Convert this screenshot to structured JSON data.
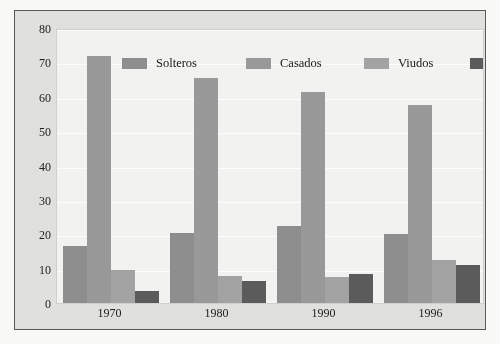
{
  "figure": {
    "frame_border_color": "#595959",
    "plot_background": "#f4f4f2",
    "page_background": "#fbfbfa",
    "gridline_color": "#ffffff"
  },
  "chart_data": {
    "type": "bar",
    "title": "",
    "subtitle": "",
    "xlabel": "",
    "ylabel": "",
    "categories": [
      "1970",
      "1980",
      "1990",
      "1996"
    ],
    "ylim": [
      0,
      80
    ],
    "yticks": [
      0,
      10,
      20,
      30,
      40,
      50,
      60,
      70,
      80
    ],
    "ytick_labels": [
      "0",
      "10",
      "20",
      "30",
      "40",
      "50",
      "60",
      "70",
      "80"
    ],
    "grid": true,
    "grid_axis": "y",
    "legend_position": "top-inside",
    "series": [
      {
        "name": "Solteros",
        "color": "#8f8f8f",
        "values": [
          16.5,
          20.5,
          22.5,
          20.0
        ]
      },
      {
        "name": "Casados",
        "color": "#9a9a9a",
        "values": [
          72.0,
          65.5,
          61.5,
          57.5
        ]
      },
      {
        "name": "Viudos",
        "color": "#a4a4a4",
        "values": [
          9.5,
          8.0,
          7.5,
          12.5
        ]
      },
      {
        "name": "Divorciados",
        "color": "#5c5c5c",
        "values": [
          3.5,
          6.5,
          8.5,
          11.0
        ]
      }
    ]
  },
  "legend": {
    "items": [
      {
        "label": "Solteros",
        "color": "#8f8f8f"
      },
      {
        "label": "Casados",
        "color": "#9a9a9a"
      },
      {
        "label": "Viudos",
        "color": "#a4a4a4"
      },
      {
        "label": "Divorciados",
        "color": "#5c5c5c"
      }
    ]
  }
}
